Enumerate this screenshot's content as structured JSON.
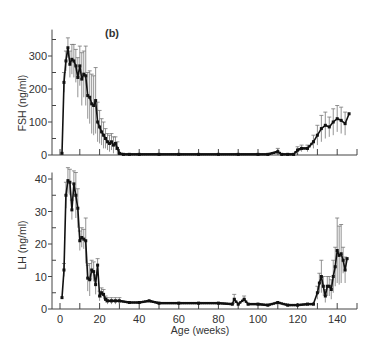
{
  "chart_data": [
    {
      "type": "line",
      "panel_label": "(b)",
      "title": "",
      "xlabel": "Age (weeks)",
      "ylabel": "FSH (ng/ml)",
      "ylim": [
        0,
        380
      ],
      "xlim": [
        -5,
        150
      ],
      "yticks": [
        0,
        100,
        200,
        300
      ],
      "yticks_minor": [
        50,
        150,
        250,
        350
      ],
      "xticks": [
        0,
        10,
        20,
        30,
        40,
        50,
        60,
        70,
        80,
        90,
        100,
        110,
        120,
        130,
        140,
        150
      ],
      "grid": false,
      "error_bars": true,
      "series": [
        {
          "name": "FSH",
          "x": [
            1,
            2,
            3,
            4,
            5,
            6,
            7,
            8,
            9,
            10,
            11,
            12,
            13,
            14,
            15,
            16,
            17,
            18,
            19,
            20,
            21,
            22,
            23,
            24,
            25,
            26,
            27,
            28,
            29,
            30,
            32,
            35,
            40,
            50,
            60,
            70,
            80,
            90,
            100,
            105,
            110,
            112,
            115,
            118,
            120,
            122,
            125,
            128,
            130,
            132,
            134,
            136,
            138,
            140,
            142,
            144,
            146
          ],
          "y": [
            5,
            220,
            285,
            325,
            275,
            290,
            285,
            270,
            235,
            270,
            230,
            245,
            240,
            180,
            175,
            155,
            150,
            165,
            100,
            85,
            70,
            60,
            50,
            40,
            35,
            40,
            30,
            35,
            20,
            5,
            2,
            2,
            2,
            2,
            2,
            2,
            2,
            2,
            2,
            2,
            10,
            2,
            2,
            2,
            15,
            20,
            20,
            40,
            60,
            80,
            90,
            85,
            100,
            110,
            105,
            95,
            125
          ],
          "err": [
            0,
            30,
            30,
            30,
            40,
            45,
            50,
            50,
            60,
            60,
            80,
            70,
            90,
            70,
            80,
            90,
            90,
            100,
            60,
            50,
            40,
            40,
            30,
            25,
            25,
            25,
            25,
            20,
            20,
            5,
            2,
            2,
            2,
            2,
            2,
            2,
            2,
            2,
            2,
            2,
            10,
            2,
            2,
            2,
            10,
            10,
            10,
            20,
            30,
            40,
            40,
            30,
            40,
            40,
            40,
            35,
            0
          ]
        }
      ]
    },
    {
      "type": "line",
      "title": "",
      "xlabel": "Age (weeks)",
      "ylabel": "LH (ng/ml)",
      "ylim": [
        0,
        42
      ],
      "xlim": [
        -5,
        150
      ],
      "yticks": [
        0,
        10,
        20,
        30,
        40
      ],
      "yticks_minor": [
        5,
        15,
        25,
        35
      ],
      "xticks": [
        0,
        20,
        40,
        60,
        80,
        100,
        120,
        140
      ],
      "xticks_minor": [
        10,
        30,
        50,
        70,
        90,
        110,
        130,
        150
      ],
      "grid": false,
      "error_bars": true,
      "series": [
        {
          "name": "LH",
          "x": [
            1,
            2,
            3,
            4,
            5,
            6,
            7,
            8,
            9,
            10,
            11,
            12,
            13,
            14,
            15,
            16,
            17,
            18,
            19,
            20,
            21,
            22,
            23,
            24,
            26,
            28,
            30,
            35,
            40,
            45,
            50,
            60,
            70,
            80,
            87,
            88,
            90,
            93,
            95,
            100,
            105,
            110,
            115,
            120,
            125,
            128,
            130,
            131,
            132,
            133,
            134,
            135,
            136,
            137,
            138,
            139,
            140,
            141,
            142,
            143,
            144,
            145
          ],
          "y": [
            3.5,
            12,
            35,
            39.5,
            39,
            30.5,
            38.5,
            35,
            31,
            21,
            22,
            21.5,
            21,
            9.5,
            9,
            12,
            11.5,
            7.5,
            13.5,
            4,
            5,
            4.5,
            3,
            2.5,
            2.5,
            2.5,
            2.5,
            2,
            2,
            2.5,
            1.8,
            1.8,
            1.8,
            1.8,
            1.5,
            3,
            1.5,
            3,
            1.5,
            1.5,
            1.2,
            2,
            1.2,
            1.2,
            1.5,
            1.5,
            5,
            8,
            10,
            7,
            4,
            7,
            7,
            6,
            10,
            13,
            18,
            16.5,
            17,
            15,
            12,
            15.5
          ],
          "err": [
            0,
            2,
            4,
            4,
            4,
            3,
            4,
            7,
            6,
            3,
            3,
            3,
            7,
            4,
            5,
            3,
            3,
            3,
            2,
            1.5,
            1.5,
            1.5,
            1,
            1,
            1,
            1,
            1,
            0.5,
            0.5,
            0.5,
            0.5,
            0.5,
            0.5,
            0.5,
            0.5,
            1.5,
            0.5,
            1,
            0.5,
            0.5,
            0.5,
            0.5,
            0.5,
            0.5,
            0.5,
            0.5,
            2,
            3,
            5,
            3,
            2,
            3,
            3,
            3,
            5,
            6,
            10,
            9,
            9,
            4,
            4,
            0
          ]
        }
      ]
    }
  ],
  "labels": {
    "panel": "(b)",
    "fsh_ylabel": "FSH (ng/ml)",
    "lh_ylabel": "LH (ng/ml)",
    "xlabel": "Age (weeks)"
  }
}
